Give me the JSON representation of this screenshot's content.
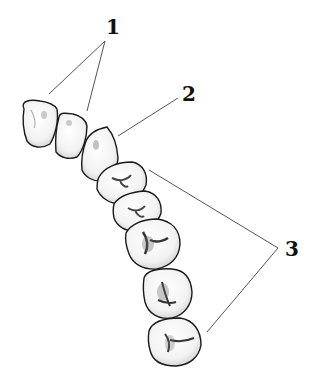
{
  "diagram": {
    "labels": [
      {
        "id": "1",
        "text": "1",
        "targets": [
          "tooth-1",
          "tooth-2"
        ]
      },
      {
        "id": "2",
        "text": "2",
        "targets": [
          "tooth-3"
        ]
      },
      {
        "id": "3",
        "text": "3",
        "targets": [
          "tooth-4",
          "tooth-8"
        ]
      }
    ],
    "teeth_count": 8
  },
  "colors": {
    "background": "#ffffff",
    "outline": "#1a1a1a",
    "leader_line": "#555555",
    "shade": "#6e6e6e",
    "label": "#111111"
  }
}
